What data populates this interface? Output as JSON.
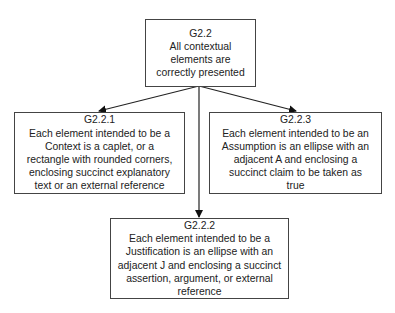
{
  "diagram": {
    "type": "goal-structure",
    "nodes": [
      {
        "id": "G2.2",
        "text": "All contextual\nelements are\ncorrectly presented"
      },
      {
        "id": "G2.2.1",
        "text": "Each element intended to be a\nContext is a caplet, or a\nrectangle with rounded corners,\nenclosing succinct explanatory\ntext or an external reference"
      },
      {
        "id": "G2.2.3",
        "text": "Each element intended to be an\nAssumption is an ellipse with an\nadjacent A and enclosing a\nsuccinct claim to be taken as\ntrue"
      },
      {
        "id": "G2.2.2",
        "text": "Each element intended to be a\nJustification is an ellipse with an\nadjacent J and enclosing a succinct\nassertion, argument, or external\nreference"
      }
    ],
    "edges": [
      {
        "from": "G2.2",
        "to": "G2.2.1"
      },
      {
        "from": "G2.2",
        "to": "G2.2.2"
      },
      {
        "from": "G2.2",
        "to": "G2.2.3"
      }
    ],
    "colors": {
      "line": "#222222",
      "border": "#444444",
      "background": "#ffffff"
    }
  }
}
